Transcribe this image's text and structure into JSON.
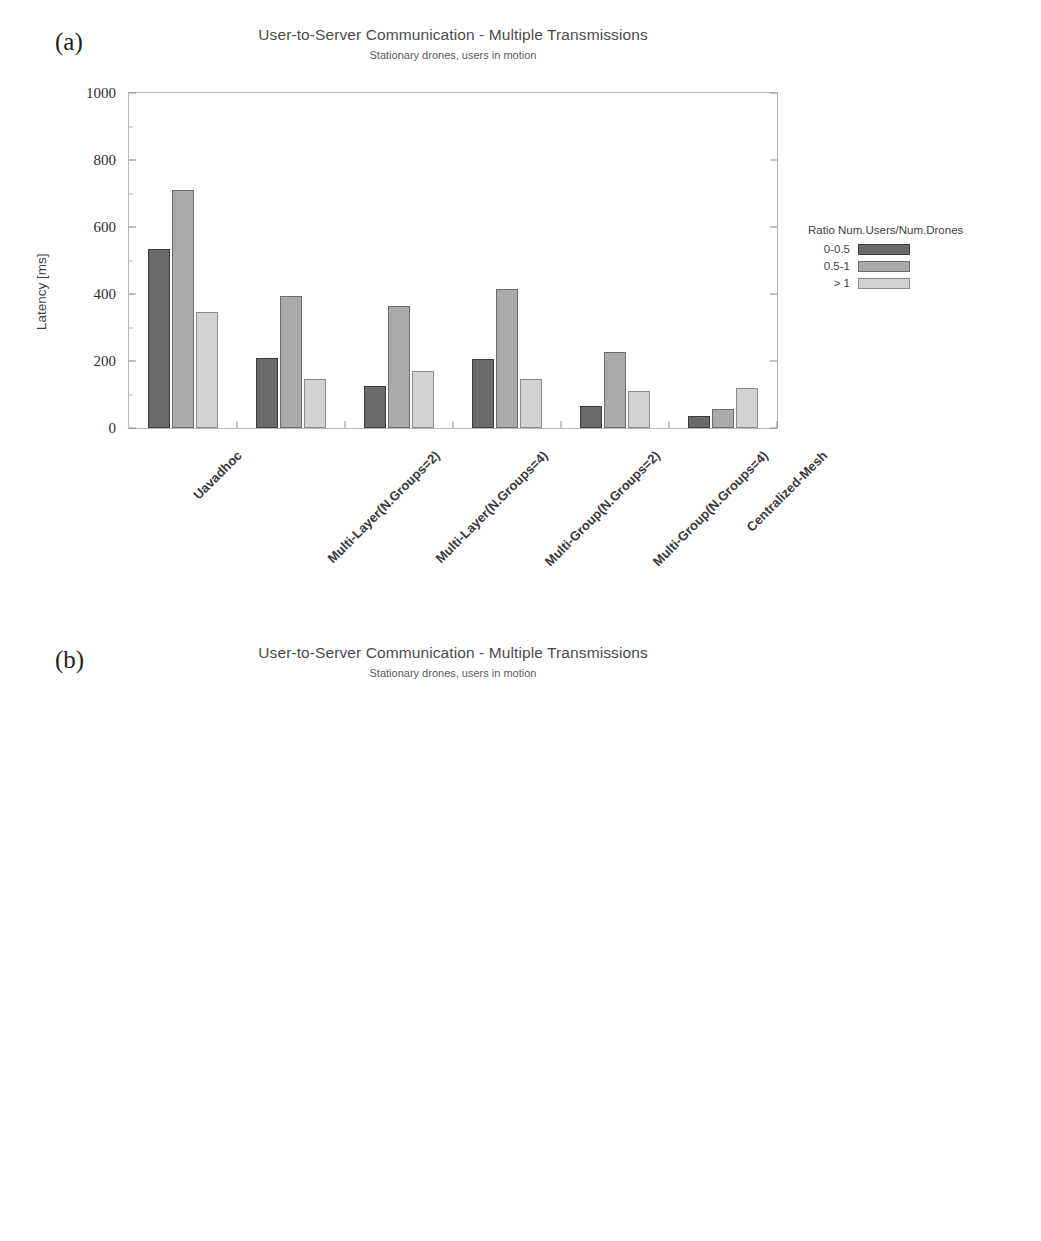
{
  "figure": {
    "panels": [
      {
        "tag": "(a)",
        "title": "User-to-Server Communication - Multiple Transmissions",
        "subtitle": "Stationary drones, users in motion"
      },
      {
        "tag": "(b)",
        "title": "User-to-Server Communication - Multiple Transmissions",
        "subtitle": "Stationary drones, users in motion"
      }
    ]
  },
  "legend": {
    "title": "Ratio Num.Users/Num.Drones",
    "entries": [
      {
        "label": "0-0.5",
        "color": "#6a6a6a"
      },
      {
        "label": "0.5-1",
        "color": "#aaaaaa"
      },
      {
        "label": "> 1",
        "color": "#d2d2d2"
      }
    ]
  },
  "chart_data": [
    {
      "type": "bar",
      "panel": "(a)",
      "title": "User-to-Server Communication - Multiple Transmissions",
      "subtitle": "Stationary drones, users in motion",
      "xlabel": "",
      "ylabel": "Latency [ms]",
      "ylim": [
        0,
        1000
      ],
      "yticks": [
        0,
        200,
        400,
        600,
        800,
        1000
      ],
      "grid": false,
      "legend_position": "right",
      "legend_title": "Ratio Num.Users/Num.Drones",
      "categories": [
        "Uavadhoc",
        "Multi-Layer(N.Groups=2)",
        "Multi-Layer(N.Groups=4)",
        "Multi-Group(N.Groups=2)",
        "Multi-Group(N.Groups=4)",
        "Centralized-Mesh"
      ],
      "series": [
        {
          "name": "0-0.5",
          "values": [
            535,
            210,
            125,
            205,
            65,
            35
          ]
        },
        {
          "name": "0.5-1",
          "values": [
            710,
            395,
            365,
            415,
            228,
            58
          ]
        },
        {
          "name": "> 1",
          "values": [
            345,
            147,
            170,
            145,
            110,
            118
          ]
        }
      ]
    },
    {
      "type": "bar",
      "panel": "(b)",
      "title": "User-to-Server Communication - Multiple Transmissions",
      "subtitle": "Stationary drones, users in motion",
      "xlabel": "",
      "ylabel": "Packet Delivery Ratio [%]",
      "ylim": [
        0,
        100
      ],
      "yticks": [
        0,
        20,
        40,
        60,
        80,
        100
      ],
      "grid": false,
      "legend_position": "right",
      "legend_title": "Ratio Num.Users/Num.Drones",
      "categories": [
        "Uavadhoc",
        "Multi-Layer(N.Groups=2)",
        "Multi-Layer(N.Groups=4)",
        "Multi-Group(N.Groups=2)",
        "Multi-Group(N.Groups=4)",
        "Centralized-Mesh"
      ],
      "series": [
        {
          "name": "0-0.5",
          "values": [
            33.5,
            55,
            64.5,
            57,
            81.3,
            84
          ]
        },
        {
          "name": "0.5-1",
          "values": [
            22.3,
            42,
            47,
            41,
            66,
            83
          ]
        },
        {
          "name": "> 1",
          "values": [
            17.5,
            35.7,
            36,
            30,
            52.5,
            75.5
          ]
        }
      ]
    }
  ]
}
